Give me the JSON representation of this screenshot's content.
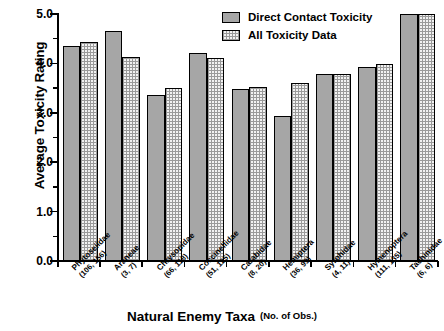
{
  "chart_data": {
    "type": "bar",
    "title": "",
    "xlabel": "Natural Enemy Taxa",
    "xlabel_note": "(No. of Obs.)",
    "ylabel": "Average Toxicity Rating",
    "ylim": [
      0.0,
      5.0
    ],
    "ytick_labels": [
      "0.0",
      "1.0",
      "2.0",
      "3.0",
      "4.0",
      "5.0"
    ],
    "ytick_values": [
      0.0,
      1.0,
      2.0,
      3.0,
      4.0,
      5.0
    ],
    "yminor_values": [
      0.5,
      1.5,
      2.5,
      3.5,
      4.5
    ],
    "grid": false,
    "legend_position": "top-right",
    "categories": [
      "Phytoseiidae",
      "Araneae",
      "Chrysopidae",
      "Coccinellidae",
      "Carabidae",
      "Hemiptera",
      "Syrphidae",
      "Hymenoptera",
      "Tachinidae"
    ],
    "observations": [
      "(106, 156)",
      "(3, 7)",
      "(66, 118)",
      "(51, 125)",
      "(8, 20)",
      "(36, 99)",
      "(4, 11)",
      "(111, 135)",
      "(6, 6)"
    ],
    "series": [
      {
        "name": "Direct Contact Toxicity",
        "fill": "solid-gray",
        "color": "#a6a6a6",
        "values": [
          4.35,
          4.65,
          3.36,
          4.22,
          3.48,
          2.93,
          3.78,
          3.92,
          5.0
        ]
      },
      {
        "name": "All Toxicity Data",
        "fill": "cross-hatch",
        "color": "#f2f2f2",
        "values": [
          4.43,
          4.12,
          3.51,
          4.11,
          3.52,
          3.61,
          3.78,
          3.98,
          5.0
        ]
      }
    ]
  }
}
